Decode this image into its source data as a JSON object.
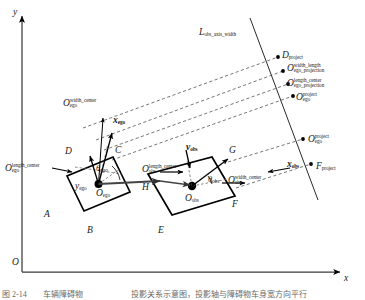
{
  "figure": {
    "type": "geometry-diagram",
    "background_color": "#ffffff",
    "line_color": "#000000",
    "dashed_color": "#555555"
  },
  "axes": {
    "origin_label": "O",
    "x_label": "x",
    "y_label": "y"
  },
  "projection_axis": {
    "label_L": "L",
    "label_sub": "obs_axis_width"
  },
  "ego_vehicle": {
    "vertices": [
      "A",
      "B",
      "C",
      "D"
    ],
    "center_label": "O",
    "center_sub": "ego",
    "heading_angle_label": "θ",
    "heading_angle_sub": "ego",
    "axis_x_label": "x",
    "axis_x_sub": "ego",
    "axis_y_label": "y",
    "axis_y_sub": "ego",
    "width_center_base": "O",
    "width_center_sub": "ego",
    "width_center_sup": "width_center",
    "length_center_base": "O",
    "length_center_sub": "ego",
    "length_center_sup": "length_center"
  },
  "obstacle_vehicle": {
    "vertices": [
      "E",
      "F",
      "G",
      "H"
    ],
    "center_label": "O",
    "center_sub": "obs",
    "heading_angle_label": "θ",
    "heading_angle_sub": "obs",
    "axis_x_label": "x",
    "axis_x_sub": "obs",
    "velocity_label": "v",
    "velocity_sub": "obs",
    "length_center_base": "O",
    "length_center_sub": "obs",
    "length_center_sup": "length_center",
    "width_center_base": "O",
    "width_center_sub": "obs",
    "width_center_sup": "width_center"
  },
  "projections": {
    "d_project_base": "D",
    "d_project_sub": "project",
    "f_project_base": "F",
    "f_project_sub": "project",
    "ego_width_length_base": "O",
    "ego_width_length_sup": "width_length",
    "ego_width_length_sub": "ego_projection",
    "ego_length_center_base": "O",
    "ego_length_center_sup": "length_center",
    "ego_length_center_sub": "ego_projection",
    "ego_project_base": "O",
    "ego_project_sup": "project",
    "ego_project_sub": "ego",
    "ego_project_lower_base": "O",
    "ego_project_lower_sup": "project",
    "ego_project_lower_sub": "ego"
  },
  "caption": {
    "text": "图 2-14　　车辆障碍物　　　　　　投影关系示意图，投影轴与障碍物车身宽方向平行"
  }
}
